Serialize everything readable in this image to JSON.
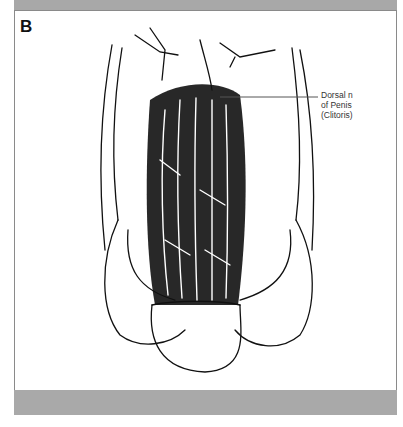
{
  "figure": {
    "panel_label": "B",
    "callout": {
      "line1": "Dorsal n",
      "line2": "of Penis",
      "line3": "(Clitoris)"
    },
    "colors": {
      "band": "#a9a9a9",
      "ink": "#111111",
      "panel_bg": "#ffffff"
    }
  }
}
